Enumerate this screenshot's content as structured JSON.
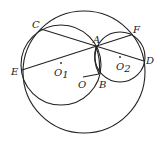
{
  "diagram": {
    "type": "geometry",
    "circles": [
      {
        "name": "O",
        "cx": 84,
        "cy": 72,
        "r": 61
      },
      {
        "name": "O1",
        "cx": 61,
        "cy": 65,
        "r": 40
      },
      {
        "name": "O2",
        "cx": 120,
        "cy": 57,
        "r": 25
      }
    ],
    "points": {
      "C": {
        "x": 41,
        "y": 29,
        "label": "C"
      },
      "A": {
        "x": 96,
        "y": 47,
        "label": "A"
      },
      "F": {
        "x": 131,
        "y": 35,
        "label": "F"
      },
      "D": {
        "x": 144,
        "y": 61,
        "label": "D"
      },
      "E": {
        "x": 22,
        "y": 70,
        "label": "E"
      },
      "B": {
        "x": 99,
        "y": 74,
        "label": "B"
      },
      "O": {
        "x": 83,
        "y": 77,
        "label": "O"
      },
      "O1": {
        "x": 61,
        "y": 63,
        "label": "O",
        "sub": "1"
      },
      "O2": {
        "x": 120,
        "y": 57,
        "label": "O",
        "sub": "2"
      }
    },
    "segments": [
      [
        "C",
        "D"
      ],
      [
        "E",
        "F"
      ],
      [
        "O",
        "B"
      ],
      [
        "A",
        "B"
      ]
    ],
    "colors": {
      "stroke": "#222222",
      "background": "#ffffff"
    }
  }
}
